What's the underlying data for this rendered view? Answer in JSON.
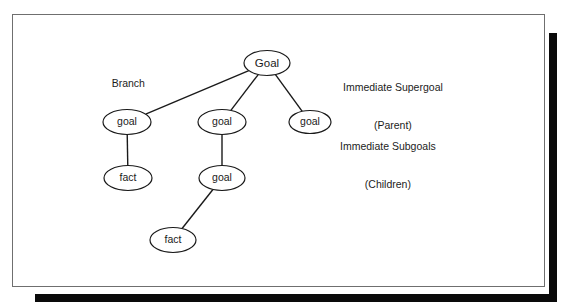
{
  "figure": {
    "background_color": "#ffffff",
    "frame_border_color": "#6f6f6f",
    "shadow_color": "#0a0a0a",
    "node_stroke_color": "#1a1a1a",
    "edge_color": "#1a1a1a"
  },
  "annotations": {
    "branch": "Branch",
    "supergoal_line1": "Immediate Supergoal",
    "supergoal_line2": "(Parent)",
    "subgoals_line1": "Immediate Subgoals",
    "subgoals_line2": "(Children)"
  },
  "diagram_data": {
    "type": "tree",
    "nodes": [
      {
        "id": "root",
        "label": "Goal",
        "cx": 267,
        "cy": 63,
        "rx": 23,
        "ry": 12.5,
        "level": 0
      },
      {
        "id": "g1",
        "label": "goal",
        "cx": 127,
        "cy": 122,
        "rx": 24,
        "ry": 12.5,
        "level": 1
      },
      {
        "id": "g2",
        "label": "goal",
        "cx": 222,
        "cy": 122,
        "rx": 24,
        "ry": 12.5,
        "level": 1
      },
      {
        "id": "g3",
        "label": "goal",
        "cx": 310,
        "cy": 122,
        "rx": 21,
        "ry": 11.5,
        "level": 1
      },
      {
        "id": "f1",
        "label": "fact",
        "cx": 128,
        "cy": 178,
        "rx": 24,
        "ry": 12.5,
        "level": 2
      },
      {
        "id": "g4",
        "label": "goal",
        "cx": 222,
        "cy": 178,
        "rx": 23,
        "ry": 12.5,
        "level": 2
      },
      {
        "id": "f2",
        "label": "fact",
        "cx": 173,
        "cy": 240,
        "rx": 23,
        "ry": 12.5,
        "level": 3
      }
    ],
    "edges": [
      {
        "from": "root",
        "to": "g1"
      },
      {
        "from": "root",
        "to": "g2"
      },
      {
        "from": "root",
        "to": "g3"
      },
      {
        "from": "g1",
        "to": "f1"
      },
      {
        "from": "g2",
        "to": "g4"
      },
      {
        "from": "g4",
        "to": "f2"
      }
    ]
  }
}
